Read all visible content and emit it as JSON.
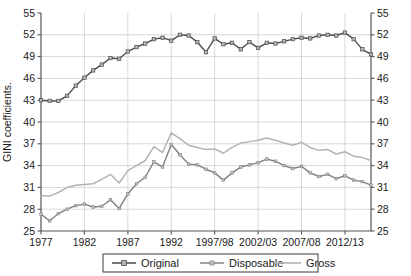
{
  "chart_data": {
    "type": "line",
    "title": "",
    "xlabel": "",
    "ylabel": "GINI coefficients.",
    "ylim": [
      25,
      55
    ],
    "yticks": [
      25,
      28,
      31,
      34,
      37,
      40,
      43,
      46,
      49,
      52,
      55
    ],
    "right_axis": true,
    "right_yticks": [
      25,
      28,
      31,
      34,
      37,
      40,
      43,
      46,
      49,
      52,
      55
    ],
    "grid": true,
    "legend_position": "bottom",
    "xtick_labels": [
      "1977",
      "1982",
      "1987",
      "1992",
      "1997/98",
      "2002/03",
      "2007/08",
      "2012/13"
    ],
    "xtick_indices": [
      0,
      5,
      10,
      15,
      20,
      25,
      30,
      35
    ],
    "x": [
      "1977",
      "1978",
      "1979",
      "1980",
      "1981",
      "1982",
      "1983",
      "1984",
      "1985",
      "1986",
      "1987",
      "1988",
      "1989",
      "1990",
      "1991",
      "1992",
      "1993",
      "1994",
      "1995",
      "1996",
      "1997/98",
      "1998/99",
      "1999/00",
      "2000/01",
      "2001/02",
      "2002/03",
      "2003/04",
      "2004/05",
      "2005/06",
      "2006/07",
      "2007/08",
      "2008/09",
      "2009/10",
      "2010/11",
      "2011/12",
      "2012/13",
      "2013/14",
      "2014/15",
      "2015/16"
    ],
    "series": [
      {
        "name": "Original",
        "color": "#4d4d4d",
        "marker": "square",
        "values": [
          43.0,
          42.9,
          42.9,
          43.6,
          45.0,
          46.1,
          47.1,
          47.9,
          48.8,
          48.7,
          49.7,
          50.3,
          50.8,
          51.4,
          51.6,
          51.2,
          52.0,
          51.9,
          51.0,
          49.6,
          51.5,
          50.7,
          50.9,
          50.0,
          51.0,
          50.2,
          50.9,
          50.8,
          51.1,
          51.4,
          51.6,
          51.5,
          51.9,
          52.0,
          51.9,
          52.3,
          51.4,
          50.0,
          49.3
        ]
      },
      {
        "name": "Disposable",
        "color": "#808080",
        "marker": "square-small",
        "values": [
          27.3,
          26.4,
          27.4,
          28.0,
          28.5,
          28.7,
          28.3,
          28.4,
          29.3,
          28.1,
          30.1,
          31.5,
          32.4,
          34.5,
          33.8,
          36.9,
          35.5,
          34.2,
          34.1,
          33.5,
          33.0,
          32.0,
          33.0,
          33.8,
          34.1,
          34.4,
          34.9,
          34.6,
          34.0,
          33.6,
          33.9,
          33.0,
          32.5,
          32.8,
          32.2,
          32.6,
          32.0,
          31.8,
          31.3
        ]
      },
      {
        "name": "Gross",
        "color": "#b3b3b3",
        "marker": "none",
        "values": [
          29.9,
          29.8,
          30.3,
          31.0,
          31.3,
          31.4,
          31.5,
          32.1,
          32.8,
          31.6,
          33.3,
          34.0,
          34.7,
          36.6,
          35.8,
          38.5,
          37.7,
          36.8,
          36.5,
          36.2,
          36.3,
          35.7,
          36.5,
          37.1,
          37.3,
          37.5,
          37.8,
          37.5,
          37.1,
          36.8,
          37.2,
          36.5,
          36.1,
          36.2,
          35.6,
          35.9,
          35.3,
          35.1,
          34.7
        ]
      }
    ]
  },
  "legend": {
    "items": [
      {
        "label": "Original"
      },
      {
        "label": "Disposable"
      },
      {
        "label": "Gross"
      }
    ]
  }
}
